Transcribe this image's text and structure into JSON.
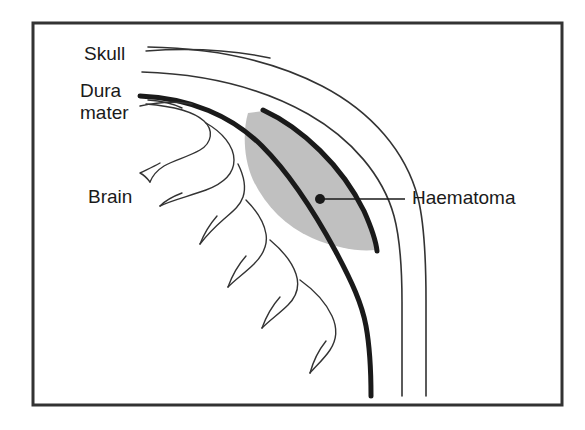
{
  "figure": {
    "name": "extradural-haematoma-cross-section",
    "background_color": "#ffffff",
    "frame": {
      "name": "figure-border",
      "stroke_color": "#333333",
      "stroke_width": 3,
      "x": 33,
      "y": 23,
      "width": 529,
      "height": 382
    },
    "colors": {
      "ink": "#1a1a1a",
      "thin_line": "#333333",
      "haematoma_fill": "#c0c0c0",
      "haematoma_edge": "#1a1a1a",
      "frame": "#333333"
    },
    "labels": [
      {
        "id": "skull",
        "text": "Skull",
        "x": 84,
        "y": 55,
        "anchor": "start",
        "leader": true
      },
      {
        "id": "dura-mater",
        "text_lines": [
          "Dura",
          "mater"
        ],
        "x": 80,
        "y": 90,
        "anchor": "start",
        "leader": true
      },
      {
        "id": "brain",
        "text": "Brain",
        "x": 88,
        "y": 198,
        "anchor": "start",
        "leader": false
      },
      {
        "id": "haematoma",
        "text": "Haematoma",
        "x": 412,
        "y": 199,
        "anchor": "start",
        "leader": true,
        "marker_dot": {
          "cx": 320,
          "cy": 199,
          "r": 5
        },
        "leader_from_x": 320,
        "leader_to_x": 405,
        "leader_y": 199
      }
    ],
    "structures": [
      {
        "id": "skull-outer-table",
        "label": "Skull",
        "stroke_width": 1.6,
        "style": "thin"
      },
      {
        "id": "skull-inner-table",
        "label": "Skull",
        "stroke_width": 1.6,
        "style": "thin"
      },
      {
        "id": "dura-mater-line",
        "label": "Dura mater",
        "stroke_width": 5,
        "style": "thick"
      },
      {
        "id": "haematoma-region",
        "label": "Haematoma",
        "style": "filled-gray"
      },
      {
        "id": "brain-surface",
        "label": "Brain",
        "stroke_width": 1.4,
        "style": "thin"
      }
    ]
  }
}
